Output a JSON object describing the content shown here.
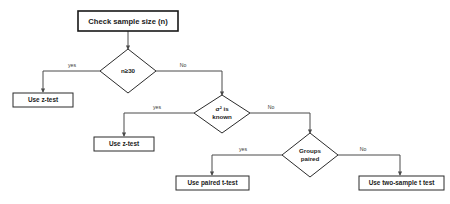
{
  "diagram": {
    "type": "flowchart",
    "title_node": {
      "id": "start",
      "label": "Check sample size (n)"
    },
    "decisions": [
      {
        "id": "d1",
        "label": "n≥30",
        "label_lines": [
          "n≥30"
        ]
      },
      {
        "id": "d2",
        "label": "σ² is known",
        "label_lines": [
          "σ²  is",
          "known"
        ]
      },
      {
        "id": "d3",
        "label": "Groups paired",
        "label_lines": [
          "Groups",
          "paired"
        ]
      }
    ],
    "terminals": [
      {
        "id": "t1",
        "label": "Use z-test"
      },
      {
        "id": "t2",
        "label": "Use z-test"
      },
      {
        "id": "t3",
        "label": "Use paired t-test"
      },
      {
        "id": "t4",
        "label": "Use two-sample t test"
      }
    ],
    "edge_labels": {
      "d1_yes": "yes",
      "d1_no": "No",
      "d2_yes": "yes",
      "d2_no": "No",
      "d3_yes": "yes",
      "d3_no": "No"
    },
    "colors": {
      "background": "#ffffff",
      "stroke": "#2b2b2b",
      "connector": "#4a4a4a",
      "text": "#1b1b1b",
      "label_text": "#3a3a3a"
    }
  }
}
